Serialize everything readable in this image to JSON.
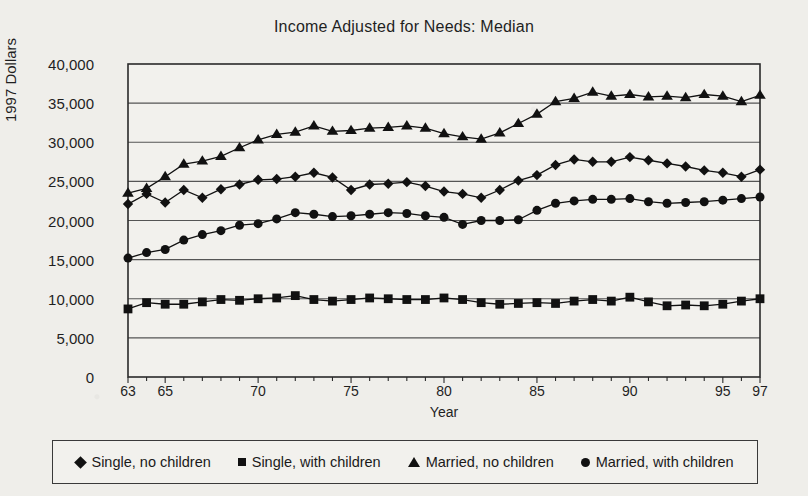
{
  "chart_data": {
    "type": "line",
    "title": "Income Adjusted for Needs: Median",
    "xlabel": "Year",
    "ylabel": "1997 Dollars",
    "grid": true,
    "legend_position": "bottom",
    "ylim": [
      0,
      40000
    ],
    "yticks": [
      "0",
      "5,000",
      "10,000",
      "15,000",
      "20,000",
      "25,000",
      "30,000",
      "35,000",
      "40,000"
    ],
    "ytick_values": [
      0,
      5000,
      10000,
      15000,
      20000,
      25000,
      30000,
      35000,
      40000
    ],
    "xlim": [
      63,
      97
    ],
    "xticks": [
      "63",
      "65",
      "70",
      "75",
      "80",
      "85",
      "90",
      "95",
      "97"
    ],
    "xtick_values": [
      63,
      65,
      70,
      75,
      80,
      85,
      90,
      95,
      97
    ],
    "x": [
      63,
      64,
      65,
      66,
      67,
      68,
      69,
      70,
      71,
      72,
      73,
      74,
      75,
      76,
      77,
      78,
      79,
      80,
      81,
      82,
      83,
      84,
      85,
      86,
      87,
      88,
      89,
      90,
      91,
      92,
      93,
      94,
      95,
      96,
      97
    ],
    "series": [
      {
        "name": "Single, no children",
        "marker": "diamond",
        "values": [
          22100,
          23400,
          22300,
          23900,
          22900,
          24000,
          24600,
          25200,
          25300,
          25600,
          26100,
          25500,
          23900,
          24600,
          24700,
          24900,
          24400,
          23700,
          23400,
          22900,
          23900,
          25100,
          25800,
          27100,
          27800,
          27500,
          27500,
          28100,
          27700,
          27300,
          26900,
          26400,
          26100,
          25600,
          26500
        ]
      },
      {
        "name": "Single, with children",
        "marker": "square",
        "values": [
          8700,
          9500,
          9300,
          9300,
          9600,
          9900,
          9800,
          10000,
          10100,
          10400,
          9900,
          9700,
          9900,
          10100,
          10000,
          9900,
          9900,
          10100,
          9900,
          9500,
          9300,
          9400,
          9500,
          9400,
          9700,
          9900,
          9700,
          10200,
          9600,
          9100,
          9200,
          9100,
          9300,
          9700,
          10000
        ]
      },
      {
        "name": "Married, no children",
        "marker": "triangle",
        "values": [
          23500,
          24100,
          25600,
          27200,
          27600,
          28200,
          29300,
          30300,
          31000,
          31300,
          32100,
          31400,
          31500,
          31800,
          31900,
          32100,
          31800,
          31100,
          30700,
          30400,
          31200,
          32400,
          33600,
          35200,
          35600,
          36400,
          35900,
          36100,
          35800,
          35900,
          35700,
          36100,
          35900,
          35200,
          36000
        ]
      },
      {
        "name": "Married, with children",
        "marker": "circle",
        "values": [
          15200,
          15900,
          16300,
          17500,
          18200,
          18700,
          19400,
          19600,
          20200,
          21000,
          20800,
          20500,
          20600,
          20800,
          21000,
          20900,
          20600,
          20400,
          19500,
          20000,
          20000,
          20100,
          21300,
          22200,
          22500,
          22700,
          22700,
          22800,
          22400,
          22200,
          22300,
          22400,
          22600,
          22800,
          23000
        ]
      }
    ]
  },
  "legend": {
    "items": [
      {
        "label": "Single, no children",
        "marker": "diamond"
      },
      {
        "label": "Single, with children",
        "marker": "square"
      },
      {
        "label": "Married, no children",
        "marker": "triangle"
      },
      {
        "label": "Married, with children",
        "marker": "circle"
      }
    ]
  },
  "colors": {
    "background": "#efeeea",
    "plot_background": "#f2f1ed",
    "ink": "#111111",
    "grid": "#555555",
    "axis": "#2a2a2a"
  }
}
